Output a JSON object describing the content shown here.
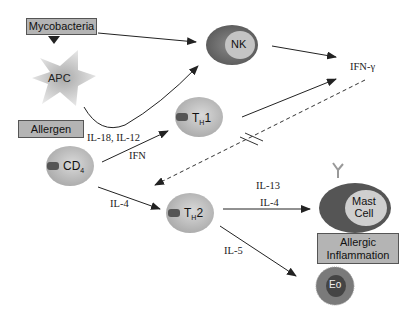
{
  "diagram": {
    "boxes": {
      "mycobacteria": "Mycobacteria",
      "allergen": "Allergen",
      "allergic_inflammation_line1": "Allergic",
      "allergic_inflammation_line2": "Inflammation"
    },
    "cells": {
      "apc": "APC",
      "nk": "NK",
      "th1_main": "T",
      "th1_sub": "H",
      "th1_suffix": "1",
      "cd4_main": "CD",
      "cd4_sub": "4",
      "th2_main": "T",
      "th2_sub": "H",
      "th2_suffix": "2",
      "mast_line1": "Mast",
      "mast_line2": "Cell",
      "eo": "Eo"
    },
    "labels": {
      "ifn_gamma": "IFN-γ",
      "il18_il12": "IL-18, IL-12",
      "ifn": "IFN",
      "il4_left": "IL-4",
      "il13": "IL-13",
      "il4_right": "IL-4",
      "il5": "IL-5"
    },
    "colors": {
      "box_fill": "#b4b4b4",
      "cell_light": "#c8c8c8",
      "cell_dark": "#6e6e6e",
      "arrow": "#222222"
    }
  }
}
